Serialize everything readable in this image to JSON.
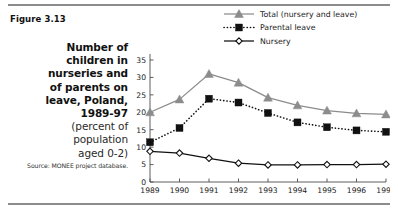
{
  "figure": {
    "number": "Figure 3.13",
    "caption_lines": [
      "Number of",
      "children in",
      "nurseries and",
      "of parents on",
      "leave, Poland,",
      "1989-97"
    ],
    "caption_sub_lines": [
      "(percent of",
      "population",
      "aged 0-2)"
    ],
    "source": "Source: MONEE project database."
  },
  "colors": {
    "total_series": "#8c8c8c",
    "parental_series": "#111111",
    "nursery_series": "#111111",
    "axis": "#4d4d4d",
    "rule": "#8c8c8c",
    "background": "#ffffff"
  },
  "chart_data": {
    "type": "line",
    "title": "Number of children in nurseries and of parents on leave, Poland, 1989-97",
    "xlabel": "",
    "ylabel": "",
    "ylim": [
      0,
      35
    ],
    "yticks": [
      0,
      5,
      10,
      15,
      20,
      25,
      30,
      35
    ],
    "ytick_labels": [
      "0",
      "5",
      "10",
      "15",
      "20",
      "25",
      "30",
      "35"
    ],
    "grid": false,
    "legend_position": "top-right",
    "categories": [
      "1989",
      "1990",
      "1991",
      "1992",
      "1993",
      "1994",
      "1995",
      "1996",
      "1997"
    ],
    "x": [
      1989,
      1990,
      1991,
      1992,
      1993,
      1994,
      1995,
      1996,
      1997
    ],
    "series": [
      {
        "name": "Total (nursery and leave)",
        "marker": "triangle",
        "line_style": "solid",
        "color": "#8c8c8c",
        "values": [
          20.0,
          23.7,
          31.0,
          28.5,
          24.2,
          22.0,
          20.5,
          19.7,
          19.4
        ]
      },
      {
        "name": "Parental leave",
        "marker": "square",
        "line_style": "dotted",
        "color": "#111111",
        "values": [
          11.4,
          15.5,
          23.9,
          22.8,
          19.8,
          17.1,
          15.7,
          14.8,
          14.4
        ]
      },
      {
        "name": "Nursery",
        "marker": "open-diamond",
        "line_style": "solid",
        "color": "#111111",
        "values": [
          8.8,
          8.3,
          6.8,
          5.4,
          4.9,
          4.9,
          5.0,
          5.0,
          5.1
        ]
      }
    ]
  }
}
